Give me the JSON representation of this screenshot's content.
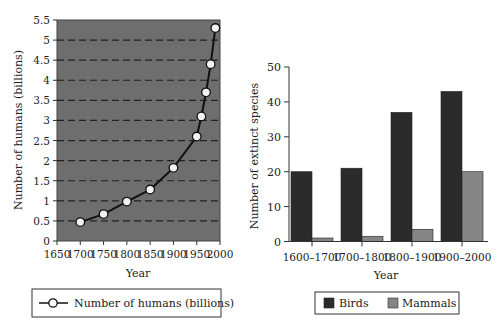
{
  "chart_data": [
    {
      "type": "line",
      "title": "",
      "xlabel": "Year",
      "ylabel": "Number of humans (billions)",
      "xlim": [
        1650,
        2000
      ],
      "ylim": [
        0,
        5.5
      ],
      "x_ticks": [
        "1650",
        "1700",
        "1750",
        "1800",
        "1850",
        "1900",
        "1950",
        "2000"
      ],
      "y_ticks": [
        "0",
        "0.5",
        "1",
        "1.5",
        "2",
        "2.5",
        "3",
        "3.5",
        "4",
        "4.5",
        "5",
        "5.5"
      ],
      "grid": "horizontal dashed",
      "background": "#6e6e6e",
      "series": [
        {
          "name": "Number of humans (billions)",
          "x": [
            1700,
            1750,
            1800,
            1850,
            1900,
            1950,
            1960,
            1970,
            1980,
            1990
          ],
          "values": [
            0.47,
            0.67,
            0.98,
            1.28,
            1.82,
            2.6,
            3.1,
            3.7,
            4.4,
            5.3
          ]
        }
      ],
      "legend": {
        "position": "bottom",
        "entries": [
          "Number of humans (billions)"
        ]
      }
    },
    {
      "type": "bar",
      "title": "",
      "xlabel": "Year",
      "ylabel": "Number of extinct species",
      "categories": [
        "1600–1700",
        "1700–1800",
        "1800–1900",
        "1900–2000"
      ],
      "ylim": [
        0,
        50
      ],
      "y_ticks": [
        "0",
        "10",
        "20",
        "30",
        "40",
        "50"
      ],
      "grid": "none",
      "series": [
        {
          "name": "Birds",
          "color": "#2b2b2b",
          "values": [
            20,
            21,
            37,
            43
          ]
        },
        {
          "name": "Mammals",
          "color": "#858585",
          "values": [
            1,
            1.5,
            3.5,
            20
          ]
        }
      ],
      "legend": {
        "position": "bottom",
        "entries": [
          "Birds",
          "Mammals"
        ]
      }
    }
  ]
}
